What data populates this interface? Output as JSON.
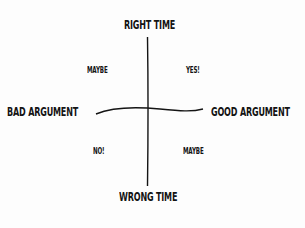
{
  "diagram": {
    "axes": {
      "top": "RIGHT TIME",
      "bottom": "WRONG TIME",
      "left": "BAD ARGUMENT",
      "right": "GOOD ARGUMENT"
    },
    "quadrants": {
      "top_left": "MAYBE",
      "top_right": "YES!",
      "bottom_left": "NO!",
      "bottom_right": "MAYBE"
    },
    "colors": {
      "ink": "#141414",
      "background": "#fdfdfd"
    }
  }
}
